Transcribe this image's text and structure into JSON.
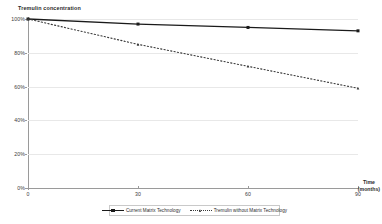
{
  "chart_data": {
    "type": "line",
    "title": "",
    "ylabel": "Tremulin concentration",
    "xlabel": "Time",
    "xunit": "(months)",
    "x": [
      0,
      30,
      60,
      90
    ],
    "xtick_labels": [
      "0",
      "30",
      "60",
      "90"
    ],
    "ytick_labels": [
      "0%",
      "20%",
      "40%",
      "60%",
      "80%",
      "100%"
    ],
    "ytick_values": [
      0,
      20,
      40,
      60,
      80,
      100
    ],
    "xlim": [
      0,
      90
    ],
    "ylim": [
      0,
      100
    ],
    "grid": true,
    "legend_position": "bottom",
    "series": [
      {
        "name": "Current Matrix Technology",
        "style": "solid",
        "marker": "square",
        "color": "#1a1a1a",
        "values": [
          100,
          97,
          95,
          93
        ]
      },
      {
        "name": "Tremulin without Matrix Technology",
        "style": "dotted",
        "marker": "triangle",
        "color": "#3a3a3a",
        "values": [
          100,
          85,
          72,
          59
        ]
      }
    ]
  },
  "legend": {
    "items": [
      {
        "label": "Current Matrix Technology"
      },
      {
        "label": "Tremulin without Matrix Technology"
      }
    ]
  }
}
